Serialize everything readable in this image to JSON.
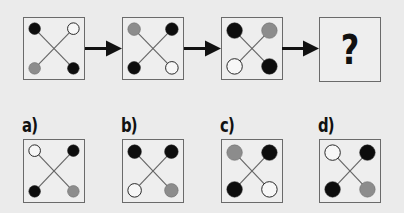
{
  "colors": {
    "black": "#0d0d0d",
    "gray": "#8c8c8c",
    "white": "#f7f7f7",
    "stroke": "#222222",
    "line": "#666666"
  },
  "sequence": [
    {
      "id": "step-1",
      "radius": 6,
      "tl": "black",
      "tr": "white",
      "bl": "gray",
      "br": "black"
    },
    {
      "id": "step-2",
      "radius": 6.5,
      "tl": "gray",
      "tr": "black",
      "bl": "black",
      "br": "white"
    },
    {
      "id": "step-3",
      "radius": 8,
      "tl": "black",
      "tr": "gray",
      "bl": "white",
      "br": "black"
    }
  ],
  "question": {
    "symbol": "?"
  },
  "options": [
    {
      "label": "a)",
      "radius": 6,
      "tl": "white",
      "tr": "black",
      "bl": "black",
      "br": "gray"
    },
    {
      "label": "b)",
      "radius": 7,
      "tl": "black",
      "tr": "black",
      "bl": "white",
      "br": "gray"
    },
    {
      "label": "c)",
      "radius": 8,
      "tl": "gray",
      "tr": "black",
      "bl": "black",
      "br": "white"
    },
    {
      "label": "d)",
      "radius": 8,
      "tl": "white",
      "tr": "black",
      "bl": "black",
      "br": "gray"
    }
  ]
}
